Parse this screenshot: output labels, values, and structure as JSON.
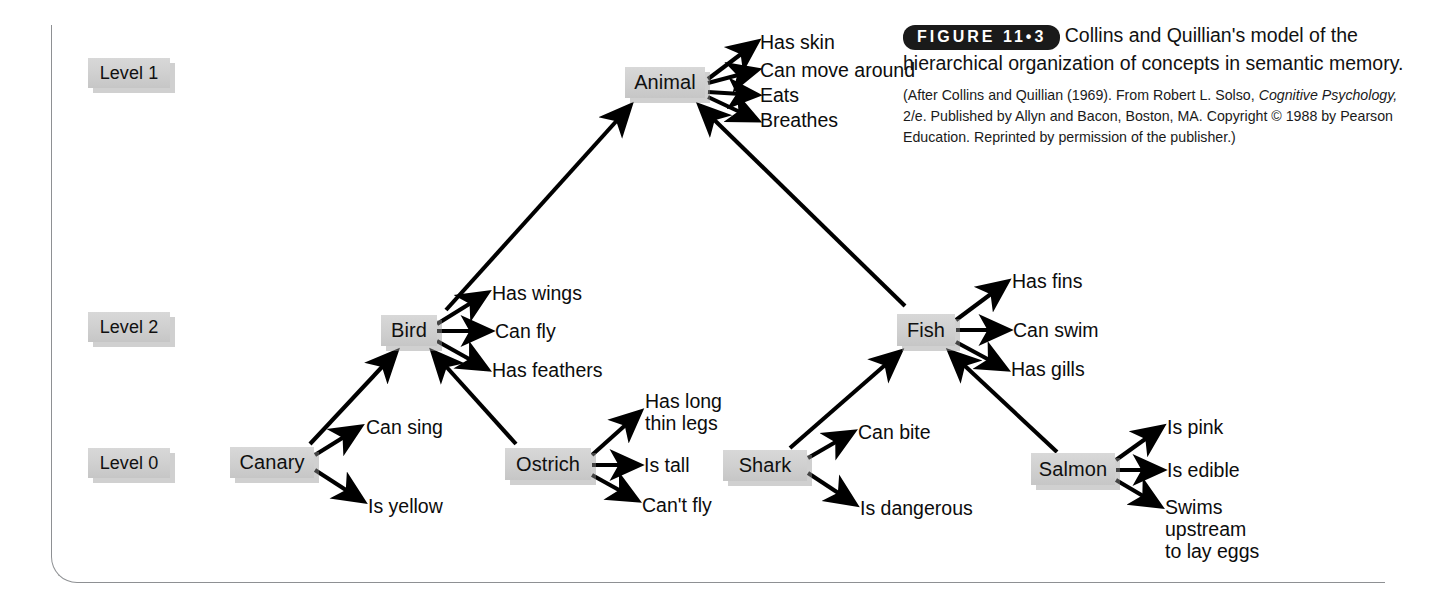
{
  "figure": {
    "tag": "FIGURE 11•3",
    "caption": "Collins and Quillian's model of the hierarchical organization of concepts in semantic memory.",
    "credit_line1": "(After Collins and Quillian (1969). From Robert L. Solso,",
    "credit_italic": "Cognitive Psychology,",
    "credit_line2_rest": " 2/e. Published by Allyn and Bacon,",
    "credit_line3": "Boston, MA. Copyright © 1988 by Pearson Education.",
    "credit_line4": "Reprinted by permission of the publisher.)"
  },
  "levels": [
    {
      "label": "Level 1"
    },
    {
      "label": "Level 2"
    },
    {
      "label": "Level 0"
    }
  ],
  "nodes": [
    {
      "id": "animal",
      "label": "Animal"
    },
    {
      "id": "bird",
      "label": "Bird"
    },
    {
      "id": "fish",
      "label": "Fish"
    },
    {
      "id": "canary",
      "label": "Canary"
    },
    {
      "id": "ostrich",
      "label": "Ostrich"
    },
    {
      "id": "shark",
      "label": "Shark"
    },
    {
      "id": "salmon",
      "label": "Salmon"
    }
  ],
  "properties": {
    "animal": [
      "Has skin",
      "Can move around",
      "Eats",
      "Breathes"
    ],
    "bird": [
      "Has wings",
      "Can fly",
      "Has feathers"
    ],
    "fish": [
      "Has fins",
      "Can swim",
      "Has gills"
    ],
    "canary": [
      "Can sing",
      "Is yellow"
    ],
    "ostrich": [
      "Has long\nthin legs",
      "Is tall",
      "Can't fly"
    ],
    "shark": [
      "Can bite",
      "Is dangerous"
    ],
    "salmon": [
      "Is pink",
      "Is edible",
      "Swims\nupstream\nto lay eggs"
    ]
  },
  "prop_text": {
    "animal_0": "Has skin",
    "animal_1": "Can move around",
    "animal_2": "Eats",
    "animal_3": "Breathes",
    "bird_0": "Has wings",
    "bird_1": "Can fly",
    "bird_2": "Has feathers",
    "fish_0": "Has fins",
    "fish_1": "Can swim",
    "fish_2": "Has gills",
    "canary_0": "Can sing",
    "canary_1": "Is yellow",
    "ostrich_0": "Has long\nthin legs",
    "ostrich_1": "Is tall",
    "ostrich_2": "Can't fly",
    "shark_0": "Can bite",
    "shark_1": "Is dangerous",
    "salmon_0": "Is pink",
    "salmon_1": "Is edible",
    "salmon_2": "Swims\nupstream\nto lay eggs"
  },
  "hierarchy_edges": [
    {
      "from": "bird",
      "to": "animal"
    },
    {
      "from": "fish",
      "to": "animal"
    },
    {
      "from": "canary",
      "to": "bird"
    },
    {
      "from": "ostrich",
      "to": "bird"
    },
    {
      "from": "shark",
      "to": "fish"
    },
    {
      "from": "salmon",
      "to": "fish"
    }
  ],
  "colors": {
    "node_fill": "#d0d0d0",
    "frame": "#8e9093",
    "text": "#0c0c0c",
    "tag_bg": "#1a1a1a",
    "arrow": "#000000"
  }
}
